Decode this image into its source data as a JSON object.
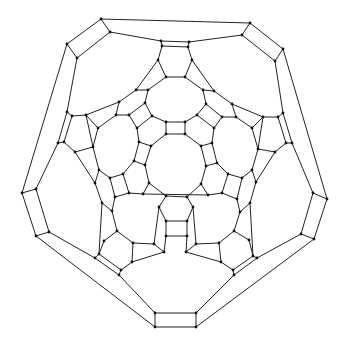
{
  "diagram": {
    "type": "graph",
    "colors": {
      "background": "#ffffff",
      "edge": "#222222",
      "node": "#111111"
    },
    "node_radius": 1.4,
    "nodes": {
      "o1": [
        101,
        19
      ],
      "o2": [
        250,
        23
      ],
      "o3": [
        67,
        44
      ],
      "o4": [
        283,
        49
      ],
      "o5": [
        22,
        193
      ],
      "o6": [
        327,
        199
      ],
      "o7": [
        36,
        236
      ],
      "o8": [
        314,
        239
      ],
      "o9": [
        155,
        327
      ],
      "o10": [
        196,
        327
      ],
      "p1": [
        110,
        32
      ],
      "p2": [
        242,
        35
      ],
      "p3": [
        77,
        58
      ],
      "p4": [
        275,
        61
      ],
      "p5": [
        36,
        189
      ],
      "p6": [
        313,
        193
      ],
      "p7": [
        49,
        232
      ],
      "p8": [
        301,
        234
      ],
      "p9": [
        155,
        313
      ],
      "p10": [
        196,
        313
      ],
      "t1": [
        161,
        41
      ],
      "t2": [
        189,
        42
      ],
      "t3": [
        162,
        46
      ],
      "t4": [
        188,
        47
      ],
      "a1": [
        158,
        60
      ],
      "a2": [
        192,
        60
      ],
      "a3": [
        166,
        77
      ],
      "a4": [
        185,
        77
      ],
      "l1": [
        67,
        112
      ],
      "l2": [
        72,
        116
      ],
      "l3": [
        86,
        115
      ],
      "l4": [
        58,
        143
      ],
      "l5": [
        64,
        142
      ],
      "l6": [
        75,
        152
      ],
      "l7": [
        93,
        147
      ],
      "r1": [
        283,
        113
      ],
      "r2": [
        278,
        117
      ],
      "r3": [
        263,
        117
      ],
      "r4": [
        286,
        143
      ],
      "r5": [
        292,
        143
      ],
      "r6": [
        258,
        149
      ],
      "r7": [
        275,
        152
      ],
      "b1": [
        95,
        258
      ],
      "b2": [
        99,
        254
      ],
      "b3": [
        119,
        275
      ],
      "b4": [
        121,
        270
      ],
      "c1": [
        253,
        256
      ],
      "c2": [
        257,
        258
      ],
      "c3": [
        233,
        270
      ],
      "c4": [
        234,
        275
      ],
      "m1": [
        136,
        90
      ],
      "m2": [
        148,
        90
      ],
      "m3": [
        119,
        102
      ],
      "m4": [
        145,
        103
      ],
      "m5": [
        116,
        115
      ],
      "m6": [
        129,
        115
      ],
      "m7": [
        152,
        116
      ],
      "m8": [
        98,
        128
      ],
      "m9": [
        137,
        128
      ],
      "n1": [
        203,
        90
      ],
      "n2": [
        214,
        91
      ],
      "n3": [
        206,
        104
      ],
      "n4": [
        232,
        104
      ],
      "n5": [
        197,
        115
      ],
      "n6": [
        222,
        117
      ],
      "n7": [
        236,
        117
      ],
      "n8": [
        214,
        128
      ],
      "n9": [
        252,
        128
      ],
      "i1": [
        166,
        122
      ],
      "i2": [
        185,
        122
      ],
      "i3": [
        166,
        134
      ],
      "i4": [
        185,
        134
      ],
      "i5": [
        139,
        142
      ],
      "i6": [
        151,
        146
      ],
      "i7": [
        201,
        146
      ],
      "i8": [
        212,
        143
      ],
      "i9": [
        134,
        161
      ],
      "i10": [
        145,
        165
      ],
      "i11": [
        206,
        166
      ],
      "i12": [
        217,
        163
      ],
      "i13": [
        149,
        183
      ],
      "i14": [
        201,
        184
      ],
      "i15": [
        143,
        194
      ],
      "i16": [
        208,
        195
      ],
      "i17": [
        166,
        196
      ],
      "i18": [
        187,
        197
      ],
      "i19": [
        159,
        207
      ],
      "i20": [
        193,
        207
      ],
      "i21": [
        166,
        221
      ],
      "i22": [
        187,
        221
      ],
      "i23": [
        166,
        236
      ],
      "i24": [
        187,
        236
      ],
      "j1": [
        99,
        170
      ],
      "j2": [
        95,
        183
      ],
      "j3": [
        110,
        178
      ],
      "j4": [
        123,
        174
      ],
      "j5": [
        129,
        193
      ],
      "j6": [
        115,
        197
      ],
      "j7": [
        102,
        203
      ],
      "j8": [
        112,
        211
      ],
      "j9": [
        117,
        231
      ],
      "j10": [
        104,
        241
      ],
      "k1": [
        252,
        170
      ],
      "k2": [
        256,
        182
      ],
      "k3": [
        228,
        174
      ],
      "k4": [
        242,
        178
      ],
      "k5": [
        222,
        193
      ],
      "k6": [
        237,
        199
      ],
      "k7": [
        250,
        203
      ],
      "k8": [
        240,
        212
      ],
      "k9": [
        234,
        231
      ],
      "k10": [
        249,
        240
      ],
      "q1": [
        133,
        243
      ],
      "q2": [
        154,
        244
      ],
      "q3": [
        164,
        252
      ],
      "q4": [
        132,
        262
      ],
      "q5": [
        196,
        244
      ],
      "q6": [
        186,
        252
      ],
      "q7": [
        219,
        243
      ],
      "q8": [
        221,
        262
      ]
    },
    "edges": [
      [
        "o1",
        "o2"
      ],
      [
        "o2",
        "o4"
      ],
      [
        "o4",
        "o6"
      ],
      [
        "o6",
        "o8"
      ],
      [
        "o8",
        "o10"
      ],
      [
        "o10",
        "o9"
      ],
      [
        "o9",
        "o7"
      ],
      [
        "o7",
        "o5"
      ],
      [
        "o5",
        "o3"
      ],
      [
        "o3",
        "o1"
      ],
      [
        "o1",
        "p1"
      ],
      [
        "o2",
        "p2"
      ],
      [
        "o3",
        "p3"
      ],
      [
        "o4",
        "p4"
      ],
      [
        "o5",
        "p5"
      ],
      [
        "o6",
        "p6"
      ],
      [
        "o7",
        "p7"
      ],
      [
        "o8",
        "p8"
      ],
      [
        "o9",
        "p9"
      ],
      [
        "o10",
        "p10"
      ],
      [
        "p1",
        "p3"
      ],
      [
        "p2",
        "p4"
      ],
      [
        "p5",
        "p7"
      ],
      [
        "p6",
        "p8"
      ],
      [
        "p9",
        "p10"
      ],
      [
        "p1",
        "t1"
      ],
      [
        "t2",
        "p2"
      ],
      [
        "t1",
        "t2"
      ],
      [
        "t1",
        "t3"
      ],
      [
        "t2",
        "t4"
      ],
      [
        "t3",
        "t4"
      ],
      [
        "t3",
        "a1"
      ],
      [
        "t4",
        "a2"
      ],
      [
        "a1",
        "a3"
      ],
      [
        "a2",
        "a4"
      ],
      [
        "a3",
        "a4"
      ],
      [
        "p3",
        "l1"
      ],
      [
        "l1",
        "l2"
      ],
      [
        "l2",
        "l3"
      ],
      [
        "l1",
        "l4"
      ],
      [
        "l2",
        "l5"
      ],
      [
        "l4",
        "l5"
      ],
      [
        "l4",
        "p5"
      ],
      [
        "l5",
        "l6"
      ],
      [
        "l6",
        "l7"
      ],
      [
        "l3",
        "l7"
      ],
      [
        "p4",
        "r1"
      ],
      [
        "r1",
        "r2"
      ],
      [
        "r2",
        "r3"
      ],
      [
        "r1",
        "r5"
      ],
      [
        "r2",
        "r4"
      ],
      [
        "r4",
        "r5"
      ],
      [
        "r5",
        "p6"
      ],
      [
        "r4",
        "r7"
      ],
      [
        "r6",
        "r7"
      ],
      [
        "r3",
        "r6"
      ],
      [
        "p7",
        "b1"
      ],
      [
        "b1",
        "b2"
      ],
      [
        "b2",
        "b4"
      ],
      [
        "b1",
        "b3"
      ],
      [
        "b3",
        "b4"
      ],
      [
        "b3",
        "p9"
      ],
      [
        "p8",
        "c2"
      ],
      [
        "c1",
        "c2"
      ],
      [
        "c1",
        "c3"
      ],
      [
        "c2",
        "c4"
      ],
      [
        "c3",
        "c4"
      ],
      [
        "c4",
        "p10"
      ],
      [
        "a1",
        "m1"
      ],
      [
        "m1",
        "m2"
      ],
      [
        "a3",
        "m2"
      ],
      [
        "m1",
        "m3"
      ],
      [
        "m2",
        "m4"
      ],
      [
        "m3",
        "l3"
      ],
      [
        "m3",
        "m5"
      ],
      [
        "m5",
        "m8"
      ],
      [
        "l3",
        "m8"
      ],
      [
        "m4",
        "m7"
      ],
      [
        "m4",
        "m6"
      ],
      [
        "m5",
        "m6"
      ],
      [
        "m6",
        "m9"
      ],
      [
        "m7",
        "m9"
      ],
      [
        "m7",
        "i1"
      ],
      [
        "a2",
        "n2"
      ],
      [
        "n1",
        "n2"
      ],
      [
        "a4",
        "n1"
      ],
      [
        "n1",
        "n3"
      ],
      [
        "n2",
        "n4"
      ],
      [
        "n4",
        "r3"
      ],
      [
        "n4",
        "n7"
      ],
      [
        "n7",
        "n9"
      ],
      [
        "r3",
        "n9"
      ],
      [
        "n3",
        "n5"
      ],
      [
        "n3",
        "n6"
      ],
      [
        "n6",
        "n7"
      ],
      [
        "n6",
        "n8"
      ],
      [
        "n5",
        "n8"
      ],
      [
        "n5",
        "i2"
      ],
      [
        "i1",
        "i2"
      ],
      [
        "i1",
        "i3"
      ],
      [
        "i2",
        "i4"
      ],
      [
        "i3",
        "i4"
      ],
      [
        "i3",
        "i6"
      ],
      [
        "i4",
        "i7"
      ],
      [
        "m9",
        "i5"
      ],
      [
        "i5",
        "i6"
      ],
      [
        "n8",
        "i8"
      ],
      [
        "i7",
        "i8"
      ],
      [
        "i5",
        "i9"
      ],
      [
        "i6",
        "i10"
      ],
      [
        "i9",
        "i10"
      ],
      [
        "i7",
        "i11"
      ],
      [
        "i8",
        "i12"
      ],
      [
        "i11",
        "i12"
      ],
      [
        "i10",
        "i13"
      ],
      [
        "i11",
        "i14"
      ],
      [
        "i13",
        "i15"
      ],
      [
        "i14",
        "i16"
      ],
      [
        "i13",
        "i17"
      ],
      [
        "i14",
        "i18"
      ],
      [
        "i17",
        "i18"
      ],
      [
        "i17",
        "i19"
      ],
      [
        "i18",
        "i20"
      ],
      [
        "i19",
        "i21"
      ],
      [
        "i20",
        "i22"
      ],
      [
        "i21",
        "i22"
      ],
      [
        "i21",
        "i23"
      ],
      [
        "i22",
        "i24"
      ],
      [
        "i23",
        "i24"
      ],
      [
        "m8",
        "l7"
      ],
      [
        "l7",
        "j1"
      ],
      [
        "l6",
        "j2"
      ],
      [
        "j1",
        "j2"
      ],
      [
        "j1",
        "j3"
      ],
      [
        "j3",
        "j4"
      ],
      [
        "j4",
        "i9"
      ],
      [
        "j3",
        "j6"
      ],
      [
        "j4",
        "j5"
      ],
      [
        "j5",
        "j6"
      ],
      [
        "j5",
        "i15"
      ],
      [
        "j2",
        "j7"
      ],
      [
        "j6",
        "j8"
      ],
      [
        "j7",
        "j8"
      ],
      [
        "j7",
        "b2"
      ],
      [
        "j8",
        "j9"
      ],
      [
        "j9",
        "j10"
      ],
      [
        "j10",
        "b2"
      ],
      [
        "j9",
        "q1"
      ],
      [
        "q1",
        "q2"
      ],
      [
        "q2",
        "i19"
      ],
      [
        "q2",
        "q3"
      ],
      [
        "q3",
        "i23"
      ],
      [
        "q1",
        "q4"
      ],
      [
        "q4",
        "b4"
      ],
      [
        "q3",
        "q4"
      ],
      [
        "n9",
        "r6"
      ],
      [
        "r6",
        "k1"
      ],
      [
        "r7",
        "k2"
      ],
      [
        "k1",
        "k2"
      ],
      [
        "k1",
        "k4"
      ],
      [
        "k3",
        "k4"
      ],
      [
        "k3",
        "i12"
      ],
      [
        "k3",
        "k5"
      ],
      [
        "k4",
        "k6"
      ],
      [
        "k5",
        "k6"
      ],
      [
        "k5",
        "i16"
      ],
      [
        "k2",
        "k7"
      ],
      [
        "k6",
        "k8"
      ],
      [
        "k7",
        "k8"
      ],
      [
        "k7",
        "c1"
      ],
      [
        "k8",
        "k9"
      ],
      [
        "k9",
        "k10"
      ],
      [
        "k10",
        "c1"
      ],
      [
        "k9",
        "q7"
      ],
      [
        "q7",
        "q5"
      ],
      [
        "q5",
        "i20"
      ],
      [
        "q5",
        "q6"
      ],
      [
        "q6",
        "i24"
      ],
      [
        "q7",
        "q8"
      ],
      [
        "q8",
        "c3"
      ],
      [
        "q6",
        "q8"
      ],
      [
        "i15",
        "i16"
      ]
    ]
  }
}
